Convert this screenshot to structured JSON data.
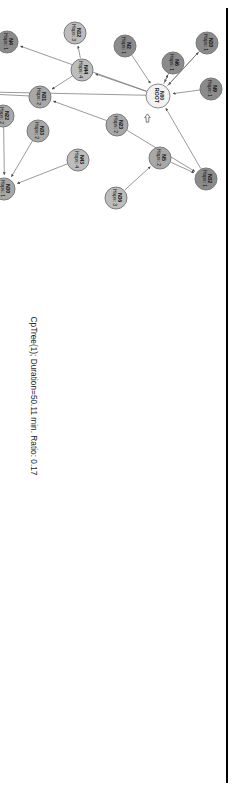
{
  "figure": {
    "caption": "CpTree(1); Duration=50.11 min. Ratio: 0.17",
    "rotation_deg": 90,
    "colors": {
      "node_dark": "#8b8b8b",
      "node_mid": "#a8a8a8",
      "node_light": "#bdbdbd",
      "node_root": "#f2f2f2",
      "edge": "#6e6e6e",
      "text": "#111111",
      "page_rule": "#000000"
    }
  },
  "chart_data": {
    "type": "diagram",
    "subtype": "directed-tree-graph",
    "title": "CpTree(1); Duration=50.11 min. Ratio: 0.17",
    "root_id": "N00",
    "hop_levels": [
      0,
      1,
      2,
      3,
      4
    ],
    "nodes": [
      {
        "id": "N00",
        "label": "N00",
        "hops_label": "ROOT",
        "hops": 0,
        "shade": "root",
        "x": 95,
        "y": 77
      },
      {
        "id": "N10",
        "label": "N10",
        "hops_label": "Hops: 1",
        "hops": 1,
        "shade": "dark",
        "x": 42,
        "y": 28
      },
      {
        "id": "N9",
        "label": "N9",
        "hops_label": "Hops: 1",
        "hops": 1,
        "shade": "dark",
        "x": 88,
        "y": 24
      },
      {
        "id": "N6",
        "label": "N6",
        "hops_label": "Hops: 1",
        "hops": 1,
        "shade": "dark",
        "x": 62,
        "y": 62
      },
      {
        "id": "N2",
        "label": "N2",
        "hops_label": "Hops: 1",
        "hops": 1,
        "shade": "dark",
        "x": 45,
        "y": 110
      },
      {
        "id": "N32",
        "label": "N32",
        "hops_label": "Hops: 1",
        "hops": 1,
        "shade": "dark",
        "x": 178,
        "y": 29
      },
      {
        "id": "N5",
        "label": "N5",
        "hops_label": "Hops: 2",
        "hops": 2,
        "shade": "mid",
        "x": 157,
        "y": 75
      },
      {
        "id": "N36",
        "label": "N36",
        "hops_label": "Hops: 3",
        "hops": 3,
        "shade": "light",
        "x": 197,
        "y": 119
      },
      {
        "id": "N23",
        "label": "N23",
        "hops_label": "Hops: 2",
        "hops": 2,
        "shade": "mid",
        "x": 124,
        "y": 118
      },
      {
        "id": "N12",
        "label": "N12",
        "hops_label": "Hops: 3",
        "hops": 3,
        "shade": "light",
        "x": 32,
        "y": 160
      },
      {
        "id": "N44",
        "label": "N44",
        "hops_label": "Hops: 4",
        "hops": 4,
        "shade": "light",
        "x": 69,
        "y": 153
      },
      {
        "id": "N43",
        "label": "N43",
        "hops_label": "Hops: 4",
        "hops": 4,
        "shade": "light",
        "x": 159,
        "y": 157
      },
      {
        "id": "N31",
        "label": "N31",
        "hops_label": "Hops: 2",
        "hops": 2,
        "shade": "mid",
        "x": 96,
        "y": 195
      },
      {
        "id": "N33",
        "label": "N33",
        "hops_label": "Hops: 2",
        "hops": 2,
        "shade": "mid",
        "x": 130,
        "y": 197
      },
      {
        "id": "N4",
        "label": "N4",
        "hops_label": "Hops: 1",
        "hops": 1,
        "shade": "dark",
        "x": 41,
        "y": 228
      },
      {
        "id": "N22",
        "label": "N22",
        "hops_label": "Hops: 2",
        "hops": 2,
        "shade": "mid",
        "x": 115,
        "y": 232
      },
      {
        "id": "N30",
        "label": "N30",
        "hops_label": "Hops: 1",
        "hops": 1,
        "shade": "mid",
        "x": 188,
        "y": 231
      },
      {
        "id": "N39",
        "label": "N39",
        "hops_label": "Hops: 3",
        "hops": 3,
        "shade": "light",
        "x": 22,
        "y": 281
      },
      {
        "id": "N41",
        "label": "N41",
        "hops_label": "Hops: 3",
        "hops": 3,
        "shade": "mid",
        "x": 90,
        "y": 318
      },
      {
        "id": "N03",
        "label": "N03",
        "hops_label": "Hops: 3",
        "hops": 3,
        "shade": "light",
        "x": 68,
        "y": 356
      },
      {
        "id": "N46",
        "label": "N46",
        "hops_label": "Hops: 3",
        "hops": 3,
        "shade": "light",
        "x": 34,
        "y": 410
      },
      {
        "id": "N47",
        "label": "N47",
        "hops_label": "Hops: 3",
        "hops": 3,
        "shade": "light",
        "x": 26,
        "y": 467
      },
      {
        "id": "N10b",
        "label": "N10",
        "hops_label": "Hops: 3",
        "hops": 3,
        "shade": "light",
        "x": 75,
        "y": 468
      },
      {
        "id": "N28",
        "label": "N28",
        "hops_label": "Hops: 2",
        "hops": 2,
        "shade": "mid",
        "x": 83,
        "y": 524
      },
      {
        "id": "N7",
        "label": "N7",
        "hops_label": "Hops: 3",
        "hops": 3,
        "shade": "light",
        "x": 25,
        "y": 578
      },
      {
        "id": "N17",
        "label": "N17",
        "hops_label": "Hops: 4",
        "hops": 4,
        "shade": "light",
        "x": 85,
        "y": 669
      },
      {
        "id": "N24",
        "label": "N24",
        "hops_label": "Hops: 3",
        "hops": 3,
        "shade": "light",
        "x": 25,
        "y": 703
      },
      {
        "id": "N18",
        "label": "N18",
        "hops_label": "Hops: 4",
        "hops": 4,
        "shade": "light",
        "x": 71,
        "y": 736
      },
      {
        "id": "N43b",
        "label": "N43",
        "hops_label": "Hops: 3",
        "hops": 3,
        "shade": "light",
        "x": 24,
        "y": 753
      }
    ],
    "edges": [
      {
        "from": "N10",
        "to": "N00"
      },
      {
        "from": "N9",
        "to": "N00"
      },
      {
        "from": "N6",
        "to": "N00"
      },
      {
        "from": "N2",
        "to": "N00"
      },
      {
        "from": "N32",
        "to": "N00"
      },
      {
        "from": "N00",
        "to": "N6"
      },
      {
        "from": "N00",
        "to": "N10"
      },
      {
        "from": "N5",
        "to": "N32"
      },
      {
        "from": "N23",
        "to": "N32"
      },
      {
        "from": "N36",
        "to": "N5"
      },
      {
        "from": "N44",
        "to": "N12"
      },
      {
        "from": "N00",
        "to": "N44"
      },
      {
        "from": "N44",
        "to": "N31"
      },
      {
        "from": "N43",
        "to": "N30"
      },
      {
        "from": "N33",
        "to": "N30"
      },
      {
        "from": "N22",
        "to": "N30"
      },
      {
        "from": "N23",
        "to": "N31"
      },
      {
        "from": "N00",
        "to": "N4"
      },
      {
        "from": "N39",
        "to": "N4"
      },
      {
        "from": "N4",
        "to": "N41"
      },
      {
        "from": "N31",
        "to": "N41"
      },
      {
        "from": "N00",
        "to": "N41"
      },
      {
        "from": "N03",
        "to": "N41"
      },
      {
        "from": "N46",
        "to": "N28"
      },
      {
        "from": "N47",
        "to": "N28"
      },
      {
        "from": "N10b",
        "to": "N28"
      },
      {
        "from": "N03",
        "to": "N28"
      },
      {
        "from": "N7",
        "to": "N28"
      },
      {
        "from": "N30",
        "to": "N28"
      },
      {
        "from": "N28",
        "to": "N24"
      },
      {
        "from": "N17",
        "to": "N24"
      },
      {
        "from": "N18",
        "to": "N24"
      },
      {
        "from": "N43b",
        "to": "N24"
      }
    ],
    "annotations": [
      {
        "name": "mouse-cursor",
        "x": 117,
        "y": 88
      }
    ]
  }
}
